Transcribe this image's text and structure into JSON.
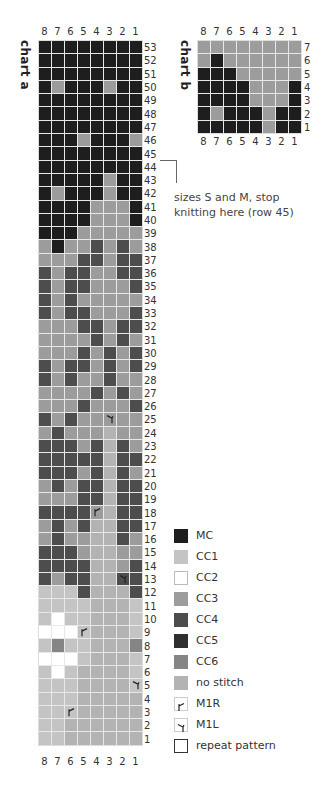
{
  "chart_a": {
    "title": "chart a",
    "columns": [
      "8",
      "7",
      "6",
      "5",
      "4",
      "3",
      "2",
      "1"
    ],
    "row_numbers": [
      "53",
      "52",
      "51",
      "50",
      "49",
      "48",
      "47",
      "46",
      "45",
      "44",
      "43",
      "42",
      "41",
      "40",
      "39",
      "38",
      "37",
      "36",
      "35",
      "34",
      "33",
      "32",
      "31",
      "30",
      "29",
      "28",
      "27",
      "26",
      "25",
      "24",
      "23",
      "22",
      "21",
      "20",
      "19",
      "18",
      "17",
      "16",
      "15",
      "14",
      "13",
      "12",
      "11",
      "10",
      "9",
      "8",
      "7",
      "6",
      "5",
      "4",
      "3",
      "2",
      "1"
    ],
    "rows": [
      [
        "MC",
        "MC",
        "MC",
        "MC",
        "MC",
        "MC",
        "MC",
        "MC"
      ],
      [
        "MC",
        "MC",
        "MC",
        "MC",
        "MC",
        "MC",
        "MC",
        "MC"
      ],
      [
        "MC",
        "MC",
        "MC",
        "MC",
        "MC",
        "MC",
        "MC",
        "MC"
      ],
      [
        "MC",
        "CC3",
        "MC",
        "MC",
        "MC",
        "CC3",
        "MC",
        "MC"
      ],
      [
        "MC",
        "MC",
        "MC",
        "MC",
        "MC",
        "MC",
        "MC",
        "MC"
      ],
      [
        "MC",
        "MC",
        "MC",
        "MC",
        "MC",
        "MC",
        "MC",
        "MC"
      ],
      [
        "MC",
        "MC",
        "MC",
        "MC",
        "MC",
        "MC",
        "MC",
        "MC"
      ],
      [
        "MC",
        "MC",
        "MC",
        "CC3",
        "MC",
        "MC",
        "MC",
        "CC3"
      ],
      [
        "MC",
        "MC",
        "MC",
        "MC",
        "MC",
        "MC",
        "MC",
        "MC"
      ],
      [
        "MC",
        "MC",
        "MC",
        "MC",
        "MC",
        "MC",
        "MC",
        "MC"
      ],
      [
        "MC",
        "MC",
        "MC",
        "MC",
        "MC",
        "CC3",
        "MC",
        "MC"
      ],
      [
        "MC",
        "CC3",
        "MC",
        "MC",
        "MC",
        "CC3",
        "MC",
        "MC"
      ],
      [
        "MC",
        "MC",
        "MC",
        "MC",
        "CC3",
        "CC3",
        "CC3",
        "MC"
      ],
      [
        "MC",
        "MC",
        "MC",
        "MC",
        "CC3",
        "CC3",
        "CC3",
        "MC"
      ],
      [
        "MC",
        "MC",
        "MC",
        "CC3",
        "CC3",
        "CC3",
        "CC3",
        "CC3"
      ],
      [
        "CC3",
        "MC",
        "CC3",
        "CC3",
        "CC4",
        "CC3",
        "CC4",
        "CC3"
      ],
      [
        "CC3",
        "CC3",
        "CC3",
        "CC4",
        "CC4",
        "CC3",
        "CC4",
        "CC4"
      ],
      [
        "CC4",
        "CC3",
        "CC4",
        "CC4",
        "CC3",
        "CC3",
        "CC4",
        "CC4"
      ],
      [
        "CC4",
        "CC3",
        "CC4",
        "CC4",
        "CC3",
        "CC3",
        "CC3",
        "CC4"
      ],
      [
        "CC4",
        "CC3",
        "CC4",
        "CC3",
        "CC3",
        "CC3",
        "CC3",
        "CC3"
      ],
      [
        "CC4",
        "CC3",
        "CC4",
        "CC4",
        "CC3",
        "CC3",
        "CC3",
        "CC4"
      ],
      [
        "CC3",
        "CC3",
        "CC3",
        "CC4",
        "CC4",
        "CC3",
        "CC4",
        "CC4"
      ],
      [
        "CC3",
        "CC3",
        "CC3",
        "CC3",
        "CC4",
        "CC3",
        "CC4",
        "CC3"
      ],
      [
        "CC3",
        "CC3",
        "CC3",
        "CC4",
        "CC3",
        "CC4",
        "CC3",
        "CC4"
      ],
      [
        "CC4",
        "CC3",
        "CC4",
        "CC4",
        "CC3",
        "CC4",
        "CC3",
        "CC4"
      ],
      [
        "CC4",
        "CC3",
        "CC4",
        "CC3",
        "CC3",
        "CC4",
        "CC3",
        "CC3"
      ],
      [
        "CC3",
        "CC3",
        "CC3",
        "CC3",
        "CC4",
        "CC3",
        "CC4",
        "CC3"
      ],
      [
        "CC3",
        "CC3",
        "CC3",
        "CC4",
        "CC3",
        "CC3",
        "CC3",
        "CC4"
      ],
      [
        "CC4",
        "CC3",
        "CC4",
        "CC3",
        "CC3",
        "CC3:M1L",
        "CC3",
        "CC3"
      ],
      [
        "CC3",
        "CC4",
        "CC3",
        "CC3",
        "CC3",
        "NS",
        "CC3",
        "CC3"
      ],
      [
        "CC4",
        "CC4",
        "CC4",
        "CC3",
        "CC4",
        "NS",
        "CC4",
        "CC3"
      ],
      [
        "CC4",
        "CC4",
        "CC4",
        "CC4",
        "CC4",
        "NS",
        "CC4",
        "CC4"
      ],
      [
        "CC4",
        "CC4",
        "CC4",
        "CC3",
        "CC4",
        "NS",
        "CC4",
        "CC3"
      ],
      [
        "CC3",
        "CC4",
        "CC3",
        "CC4",
        "CC4",
        "NS",
        "CC4",
        "CC4"
      ],
      [
        "CC3",
        "CC3",
        "CC3",
        "CC4",
        "CC4",
        "NS",
        "CC4",
        "CC4"
      ],
      [
        "CC4",
        "CC4",
        "CC4",
        "CC4",
        "CC3:M1R",
        "NS",
        "CC4",
        "CC4"
      ],
      [
        "CC3",
        "CC4",
        "CC3",
        "CC4",
        "NS",
        "NS",
        "CC4",
        "CC4"
      ],
      [
        "CC3",
        "CC4",
        "CC3",
        "CC3",
        "NS",
        "NS",
        "CC4",
        "CC3"
      ],
      [
        "CC4",
        "CC4",
        "CC4",
        "CC3",
        "NS",
        "NS",
        "CC3",
        "CC3"
      ],
      [
        "CC4",
        "CC4",
        "CC4",
        "CC4",
        "NS",
        "NS",
        "CC3",
        "CC4"
      ],
      [
        "CC4",
        "CC3",
        "CC4",
        "CC4",
        "NS",
        "NS",
        "CC4:M1L",
        "CC4"
      ],
      [
        "CC1",
        "CC1",
        "CC1",
        "CC4",
        "NS",
        "NS",
        "NS",
        "CC4"
      ],
      [
        "CC1",
        "CC1",
        "CC1",
        "CC1",
        "NS",
        "NS",
        "NS",
        "CC1"
      ],
      [
        "CC1",
        "CC2",
        "CC1",
        "CC1",
        "NS",
        "NS",
        "NS",
        "CC1"
      ],
      [
        "CC2",
        "CC2",
        "CC2",
        "CC1:M1R",
        "NS",
        "NS",
        "NS",
        "CC1"
      ],
      [
        "CC1",
        "CC6",
        "CC1",
        "CC1",
        "NS",
        "NS",
        "NS",
        "CC6"
      ],
      [
        "CC2",
        "CC2",
        "CC2",
        "CC1",
        "NS",
        "NS",
        "NS",
        "CC1"
      ],
      [
        "CC1",
        "CC2",
        "CC1",
        "NS",
        "NS",
        "NS",
        "NS",
        "CC1"
      ],
      [
        "CC1",
        "CC1",
        "CC1",
        "NS",
        "NS",
        "NS",
        "NS",
        "CC1:M1L"
      ],
      [
        "CC1",
        "CC1",
        "CC1",
        "NS",
        "NS",
        "NS",
        "NS",
        "NS"
      ],
      [
        "CC1",
        "CC1",
        "CC1:M1R",
        "NS",
        "NS",
        "NS",
        "NS",
        "NS"
      ],
      [
        "CC1",
        "CC1",
        "NS",
        "NS",
        "NS",
        "NS",
        "NS",
        "NS"
      ],
      [
        "CC1",
        "CC1",
        "NS",
        "NS",
        "NS",
        "NS",
        "NS",
        "NS"
      ]
    ],
    "note": {
      "line1": "sizes S and M, stop",
      "line2": "knitting here (row 45)"
    }
  },
  "chart_b": {
    "title": "chart b",
    "columns": [
      "8",
      "7",
      "6",
      "5",
      "4",
      "3",
      "2",
      "1"
    ],
    "row_numbers": [
      "7",
      "6",
      "5",
      "4",
      "3",
      "2",
      "1"
    ],
    "rows": [
      [
        "CC3",
        "CC3",
        "CC3",
        "CC3",
        "CC3",
        "CC3",
        "CC3",
        "CC3"
      ],
      [
        "CC3",
        "MC",
        "CC3",
        "CC3",
        "CC3",
        "CC3",
        "CC3",
        "CC3"
      ],
      [
        "MC",
        "MC",
        "MC",
        "CC3",
        "CC3",
        "CC3",
        "CC3",
        "CC3"
      ],
      [
        "MC",
        "MC",
        "MC",
        "MC",
        "CC3",
        "CC3",
        "CC3",
        "MC"
      ],
      [
        "MC",
        "MC",
        "MC",
        "MC",
        "CC3",
        "CC3",
        "CC3",
        "MC"
      ],
      [
        "MC",
        "CC3",
        "MC",
        "MC",
        "MC",
        "CC3",
        "MC",
        "MC"
      ],
      [
        "MC",
        "MC",
        "MC",
        "MC",
        "MC",
        "CC3",
        "MC",
        "MC"
      ]
    ]
  },
  "legend": [
    {
      "key": "MC",
      "label": "MC",
      "color": "#1e1e1e"
    },
    {
      "key": "CC1",
      "label": "CC1",
      "color": "#c4c4c4"
    },
    {
      "key": "CC2",
      "label": "CC2",
      "color": "#ffffff"
    },
    {
      "key": "CC3",
      "label": "CC3",
      "color": "#9c9c9c"
    },
    {
      "key": "CC4",
      "label": "CC4",
      "color": "#4d4d4d"
    },
    {
      "key": "CC5",
      "label": "CC5",
      "color": "#2f2f2f"
    },
    {
      "key": "CC6",
      "label": "CC6",
      "color": "#858585"
    },
    {
      "key": "NS",
      "label": "no stitch",
      "color": "#b3b3b3"
    },
    {
      "key": "M1R",
      "label": "M1R",
      "symbol": "m1r-icon"
    },
    {
      "key": "M1L",
      "label": "M1L",
      "symbol": "m1l-icon"
    },
    {
      "key": "REPEAT",
      "label": "repeat pattern",
      "symbol": "repeat-box"
    }
  ]
}
